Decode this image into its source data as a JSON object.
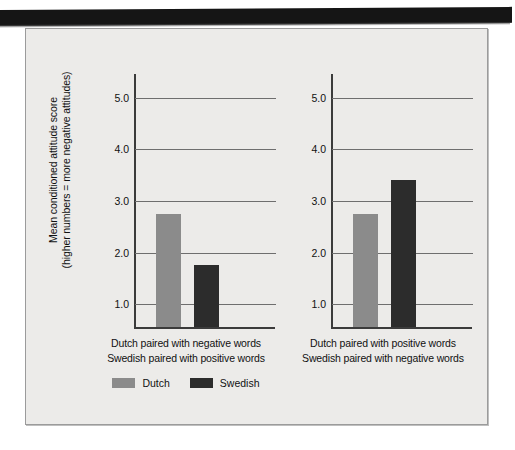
{
  "figure": {
    "background_color": "#ecebe9",
    "scan_band_color": "#151515"
  },
  "chart_data": {
    "type": "bar",
    "title": "",
    "subtitle": "",
    "xlabel": "",
    "ylabel": "Mean conditioned attitude score (higher numbers = more negative attitudes)",
    "ylabel_line1": "Mean conditioned attitude score",
    "ylabel_line2": "(higher numbers = more negative attitudes)",
    "ylim": [
      0,
      5.5
    ],
    "yticks": [
      "1.0",
      "2.0",
      "3.0",
      "4.0",
      "5.0"
    ],
    "ytick_values": [
      1.0,
      2.0,
      3.0,
      4.0,
      5.0
    ],
    "grid": true,
    "legend_position": "bottom",
    "panels": [
      {
        "name": "panel-left",
        "category_line1": "Dutch paired with negative words",
        "category_line2": "Swedish paired with positive words",
        "bars": [
          {
            "series": "Dutch",
            "value": 2.75,
            "color": "#8b8b8b"
          },
          {
            "series": "Swedish",
            "value": 1.75,
            "color": "#2c2c2c"
          }
        ]
      },
      {
        "name": "panel-right",
        "category_line1": "Dutch paired with positive words",
        "category_line2": "Swedish paired with negative words",
        "bars": [
          {
            "series": "Dutch",
            "value": 2.75,
            "color": "#8b8b8b"
          },
          {
            "series": "Swedish",
            "value": 3.4,
            "color": "#2c2c2c"
          }
        ]
      }
    ],
    "series": [
      {
        "name": "Dutch",
        "color": "#8b8b8b",
        "values": [
          2.75,
          2.75
        ]
      },
      {
        "name": "Swedish",
        "color": "#2c2c2c",
        "values": [
          1.75,
          3.4
        ]
      }
    ],
    "categories": [
      "Dutch paired with negative words / Swedish paired with positive words",
      "Dutch paired with positive words / Swedish paired with negative words"
    ],
    "legend": [
      {
        "label": "Dutch",
        "color": "#8b8b8b"
      },
      {
        "label": "Swedish",
        "color": "#2c2c2c"
      }
    ]
  }
}
